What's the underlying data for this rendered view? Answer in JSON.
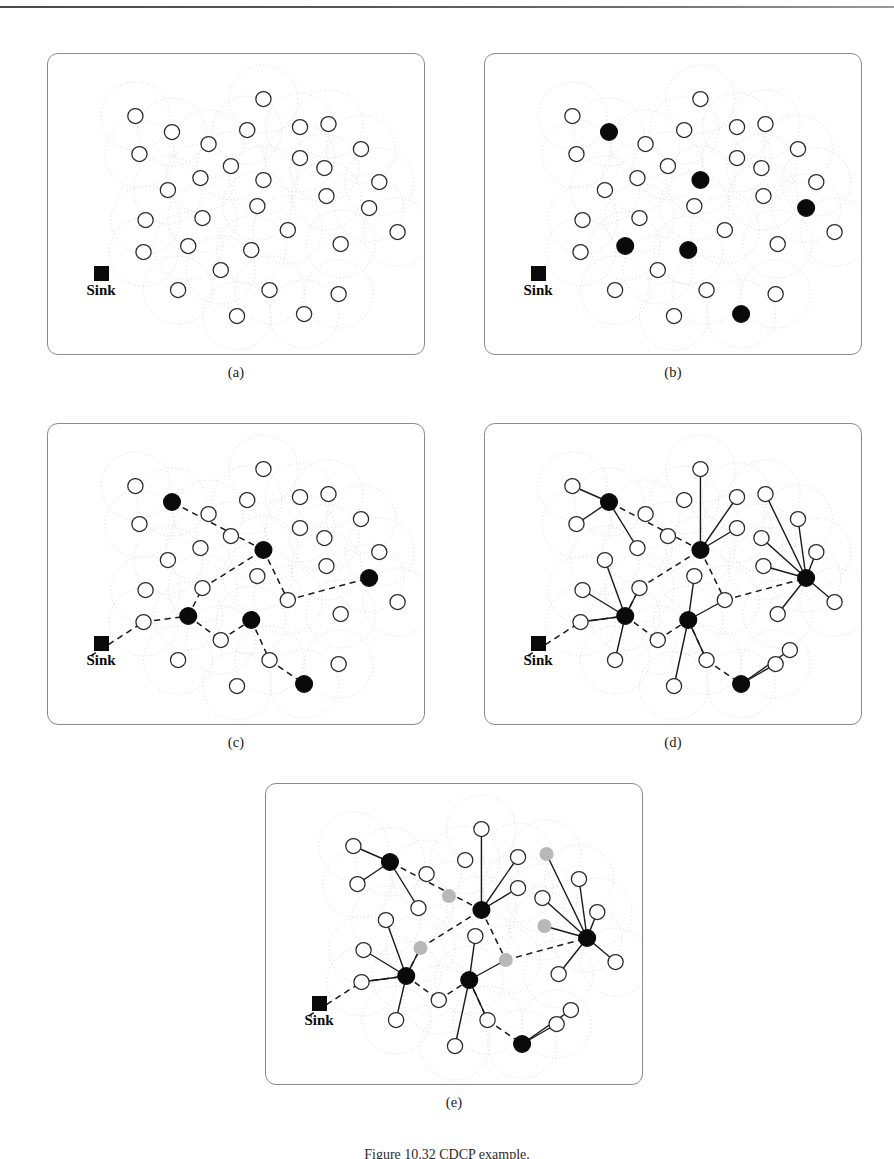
{
  "figure": {
    "caption": "Figure 10.32    CDCP example.",
    "caption_visible_partial": true,
    "background_color": "#ffffff",
    "node_colors": {
      "regular_node_fill": "#ffffff",
      "regular_node_stroke": "#2b2b2b",
      "cluster_head_fill": "#0a0a0a",
      "sleeping_node_fill": "#b8b8b8",
      "coverage_circle_stroke": "#d8d8dc",
      "backbone_link_stroke": "#1a1a1a",
      "member_link_stroke": "#1a1a1a",
      "sink_color": "#0a0a0a",
      "panel_border": "#8b8b8b"
    },
    "sink_label": "Sink",
    "panels": [
      {
        "id": "a",
        "label": "(a)",
        "title": "Randomly deployed sensor nodes with sensing ranges",
        "show_cluster_heads": false,
        "show_backbone": false,
        "show_member_links": false,
        "show_sleeping": false
      },
      {
        "id": "b",
        "label": "(b)",
        "title": "Cluster heads elected",
        "show_cluster_heads": true,
        "show_backbone": false,
        "show_member_links": false,
        "show_sleeping": false
      },
      {
        "id": "c",
        "label": "(c)",
        "title": "Backbone routing paths to sink formed",
        "show_cluster_heads": true,
        "show_backbone": true,
        "show_member_links": false,
        "show_sleeping": false
      },
      {
        "id": "d",
        "label": "(d)",
        "title": "Members join their cluster heads",
        "show_cluster_heads": true,
        "show_backbone": true,
        "show_member_links": true,
        "show_sleeping": false
      },
      {
        "id": "e",
        "label": "(e)",
        "title": "Redundant nodes turned to sleep",
        "show_cluster_heads": true,
        "show_backbone": true,
        "show_member_links": true,
        "show_sleeping": true
      }
    ]
  },
  "chart_data": {
    "type": "diagram",
    "title": "CDCP example",
    "diagram_kind": "wireless-sensor-network-clustering",
    "panel_count": 5,
    "node_count": 33,
    "cluster_head_count": 6,
    "sleeping_node_count": 5,
    "sink_count_per_panel": 1,
    "node_radius_px": 7.5,
    "coverage_radius_px": 34,
    "panel_box_px": {
      "width": 370,
      "height": 300
    },
    "sink_position": {
      "x": 42,
      "y": 232
    },
    "nodes": [
      {
        "id": 0,
        "x": 86,
        "y": 62
      },
      {
        "id": 1,
        "x": 122,
        "y": 78
      },
      {
        "id": 2,
        "x": 158,
        "y": 90
      },
      {
        "id": 3,
        "x": 196,
        "y": 76
      },
      {
        "id": 4,
        "x": 212,
        "y": 45
      },
      {
        "id": 5,
        "x": 248,
        "y": 73
      },
      {
        "id": 6,
        "x": 276,
        "y": 70
      },
      {
        "id": 7,
        "x": 90,
        "y": 100
      },
      {
        "id": 8,
        "x": 308,
        "y": 95
      },
      {
        "id": 9,
        "x": 248,
        "y": 104
      },
      {
        "id": 10,
        "x": 180,
        "y": 112
      },
      {
        "id": 11,
        "x": 150,
        "y": 124
      },
      {
        "id": 12,
        "x": 272,
        "y": 114
      },
      {
        "id": 13,
        "x": 118,
        "y": 136
      },
      {
        "id": 14,
        "x": 212,
        "y": 126
      },
      {
        "id": 15,
        "x": 326,
        "y": 128
      },
      {
        "id": 16,
        "x": 274,
        "y": 142
      },
      {
        "id": 17,
        "x": 206,
        "y": 152
      },
      {
        "id": 18,
        "x": 316,
        "y": 154
      },
      {
        "id": 19,
        "x": 96,
        "y": 166
      },
      {
        "id": 20,
        "x": 152,
        "y": 164
      },
      {
        "id": 21,
        "x": 236,
        "y": 176
      },
      {
        "id": 22,
        "x": 94,
        "y": 198
      },
      {
        "id": 23,
        "x": 138,
        "y": 192
      },
      {
        "id": 24,
        "x": 200,
        "y": 196
      },
      {
        "id": 25,
        "x": 288,
        "y": 190
      },
      {
        "id": 26,
        "x": 170,
        "y": 216
      },
      {
        "id": 27,
        "x": 128,
        "y": 236
      },
      {
        "id": 28,
        "x": 218,
        "y": 236
      },
      {
        "id": 29,
        "x": 286,
        "y": 240
      },
      {
        "id": 30,
        "x": 186,
        "y": 262
      },
      {
        "id": 31,
        "x": 252,
        "y": 260
      },
      {
        "id": 32,
        "x": 344,
        "y": 178
      }
    ],
    "cluster_heads": [
      {
        "id": "ch1",
        "node": 1,
        "x": 122,
        "y": 78
      },
      {
        "id": "ch2",
        "node": 14,
        "x": 212,
        "y": 126
      },
      {
        "id": "ch3",
        "node": 18,
        "x": 316,
        "y": 154
      },
      {
        "id": "ch4",
        "node": 23,
        "x": 138,
        "y": 192
      },
      {
        "id": "ch5",
        "node": 24,
        "x": 200,
        "y": 196
      },
      {
        "id": "ch6",
        "node": 31,
        "x": 252,
        "y": 260
      }
    ],
    "backbone_links": [
      {
        "from": "sink",
        "to": 22
      },
      {
        "from": 22,
        "to": "ch4"
      },
      {
        "from": "ch4",
        "to": 20
      },
      {
        "from": 20,
        "to": "ch2"
      },
      {
        "from": "ch2",
        "to": "ch1"
      },
      {
        "from": "ch2",
        "to": 21
      },
      {
        "from": 21,
        "to": "ch3"
      },
      {
        "from": "ch4",
        "to": 26
      },
      {
        "from": 26,
        "to": "ch5"
      },
      {
        "from": "ch5",
        "to": 28
      },
      {
        "from": 28,
        "to": "ch6"
      }
    ],
    "member_links": [
      {
        "head": "ch1",
        "member": 0
      },
      {
        "head": "ch1",
        "member": 7
      },
      {
        "head": "ch1",
        "member": 11
      },
      {
        "head": "ch2",
        "member": 4
      },
      {
        "head": "ch2",
        "member": 5
      },
      {
        "head": "ch2",
        "member": 9
      },
      {
        "head": "ch3",
        "member": 6
      },
      {
        "head": "ch3",
        "member": 8
      },
      {
        "head": "ch3",
        "member": 12
      },
      {
        "head": "ch3",
        "member": 15
      },
      {
        "head": "ch3",
        "member": 16
      },
      {
        "head": "ch3",
        "member": 32
      },
      {
        "head": "ch3",
        "member": 25
      },
      {
        "head": "ch4",
        "member": 13
      },
      {
        "head": "ch4",
        "member": 19
      },
      {
        "head": "ch4",
        "member": 22
      },
      {
        "head": "ch4",
        "member": 20
      },
      {
        "head": "ch4",
        "member": 27
      },
      {
        "head": "ch5",
        "member": 17
      },
      {
        "head": "ch5",
        "member": 21
      },
      {
        "head": "ch5",
        "member": 30
      },
      {
        "head": "ch5",
        "member": 28
      },
      {
        "head": "ch6",
        "member": 29
      },
      {
        "head": "ch6",
        "member": 34
      }
    ],
    "extra_nodes": [
      {
        "id": 34,
        "x": 300,
        "y": 226
      }
    ],
    "sleeping_nodes": [
      {
        "id": 10,
        "x": 180,
        "y": 112
      },
      {
        "id": 20,
        "x": 152,
        "y": 164
      },
      {
        "id": 16,
        "x": 274,
        "y": 142
      },
      {
        "id": 6,
        "x": 276,
        "y": 70
      },
      {
        "id": 21,
        "x": 236,
        "y": 176
      }
    ],
    "coverage_circles_shown_in_all_panels": true,
    "legend": [
      {
        "symbol": "white-circle",
        "meaning": "ordinary sensor node"
      },
      {
        "symbol": "black-circle",
        "meaning": "cluster head"
      },
      {
        "symbol": "gray-circle",
        "meaning": "sleeping / redundant node"
      },
      {
        "symbol": "black-square",
        "meaning": "sink"
      },
      {
        "symbol": "dashed-line",
        "meaning": "backbone route to sink"
      },
      {
        "symbol": "solid-line",
        "meaning": "member to cluster-head link"
      },
      {
        "symbol": "dotted-circle",
        "meaning": "sensing coverage range"
      }
    ]
  }
}
